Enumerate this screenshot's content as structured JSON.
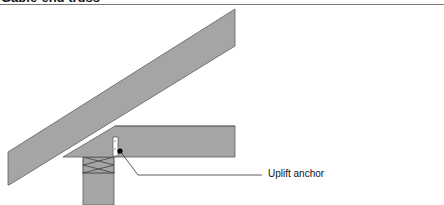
{
  "header": {
    "title": "Gable-end truss"
  },
  "diagram": {
    "callouts": [
      {
        "id": "uplift-anchor",
        "label": "Uplift anchor"
      }
    ],
    "components": [
      "rafter",
      "ceiling-joist",
      "top-plate",
      "wall-stud",
      "uplift-anchor-bracket"
    ],
    "colors": {
      "lumber_fill": "#a5a5a5",
      "lumber_stroke": "#5e5e5e",
      "anchor_fill": "#ffffff",
      "anchor_dot": "#000000",
      "leader_line": "#333333"
    }
  }
}
